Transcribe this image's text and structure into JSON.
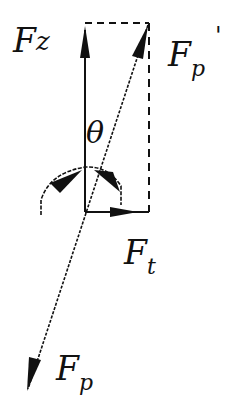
{
  "diagram": {
    "type": "force-decomposition",
    "colors": {
      "line": "#111111",
      "background": "#ffffff"
    },
    "labels": {
      "fz_main": "F",
      "fz_sub": "z",
      "fp_prime_main": "F",
      "fp_prime_sub": "p",
      "fp_prime_mark": "'",
      "theta": "θ",
      "ft_main": "F",
      "ft_sub": "t",
      "fp_main": "F",
      "fp_sub": "p"
    },
    "vectors": [
      {
        "name": "Fz",
        "from": [
          85,
          212
        ],
        "to": [
          85,
          25
        ],
        "style": "solid"
      },
      {
        "name": "Fp'",
        "from": [
          85,
          212
        ],
        "to": [
          148,
          25
        ],
        "style": "solid"
      },
      {
        "name": "Ft",
        "from": [
          85,
          212
        ],
        "to": [
          149,
          212
        ],
        "style": "solid"
      },
      {
        "name": "Fp",
        "from": [
          85,
          212
        ],
        "to": [
          28,
          389
        ],
        "style": "solid"
      }
    ],
    "dashed_lines": [
      {
        "from": [
          85,
          23
        ],
        "to": [
          149,
          23
        ]
      },
      {
        "from": [
          149,
          23
        ],
        "to": [
          149,
          212
        ]
      }
    ]
  }
}
